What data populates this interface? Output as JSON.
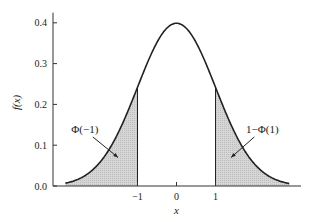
{
  "chart_data": {
    "type": "area",
    "title": "",
    "xlabel": "x",
    "ylabel": "f(x)",
    "xlim": [
      -3,
      3.3
    ],
    "ylim": [
      0,
      0.42
    ],
    "curve_range": [
      -2.85,
      2.9
    ],
    "x_ticks": [
      {
        "value": -1,
        "label": "-1"
      },
      {
        "value": 0,
        "label": "0"
      },
      {
        "value": 1,
        "label": "1"
      }
    ],
    "y_ticks": [
      {
        "value": 0.0,
        "label": "0.0"
      },
      {
        "value": 0.1,
        "label": "0.1"
      },
      {
        "value": 0.2,
        "label": "0.2"
      },
      {
        "value": 0.3,
        "label": "0.3"
      },
      {
        "value": 0.4,
        "label": "0.4"
      }
    ],
    "series": [
      {
        "name": "standard normal pdf",
        "function": "exp(-x^2/2)/sqrt(2*pi)",
        "mean": 0,
        "sd": 1,
        "peak": 0.3989
      }
    ],
    "shaded_regions": [
      {
        "name": "left-tail",
        "from": -2.85,
        "to": -1,
        "label": "Φ(−1)",
        "boundary_value": 0.242
      },
      {
        "name": "right-tail",
        "from": 1,
        "to": 2.9,
        "label": "1−Φ(1)",
        "boundary_value": 0.242
      }
    ],
    "annotations": [
      {
        "text": "Φ(−1)",
        "points_to": {
          "x": -1.5,
          "y": 0.07
        },
        "text_at": {
          "x": -2.35,
          "y": 0.13
        }
      },
      {
        "text": "1−Φ(1)",
        "points_to": {
          "x": 1.4,
          "y": 0.07
        },
        "text_at": {
          "x": 2.2,
          "y": 0.13
        }
      }
    ],
    "grid": false,
    "legend": "none",
    "colors": {
      "curve": "#222222",
      "shade": "#d6d6d6",
      "axis": "#333333"
    }
  }
}
